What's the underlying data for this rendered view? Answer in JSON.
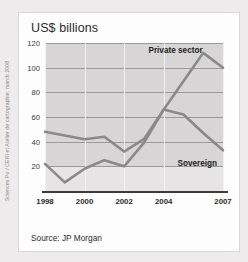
{
  "credit": {
    "text": "Sciences Po / CERI et Atelier de cartographie, march 2008"
  },
  "card": {
    "title": "US$ billions",
    "source_note": "Source: JP Morgan"
  },
  "chart_data": {
    "type": "line",
    "title": "US$ billions",
    "xlabel": "",
    "ylabel": "US$ billions",
    "ylim": [
      0,
      120
    ],
    "yticks": [
      20,
      40,
      60,
      80,
      100,
      120
    ],
    "xticks": [
      "1998",
      "2000",
      "2002",
      "2004",
      "2007"
    ],
    "x": [
      1998,
      1999,
      2000,
      2001,
      2002,
      2003,
      2004,
      2005,
      2006,
      2007
    ],
    "grid": "horizontal",
    "legend_position": "inline-annotation",
    "series": [
      {
        "name": "Private sector",
        "color": "#8b8888",
        "values": [
          48,
          45,
          42,
          44,
          32,
          42,
          66,
          89,
          112,
          100
        ],
        "annotation": "Private sector"
      },
      {
        "name": "Sovereign",
        "color": "#8b8888",
        "values": [
          22,
          7,
          18,
          25,
          20,
          39,
          66,
          62,
          47,
          33
        ],
        "annotation": "Sovereign"
      }
    ],
    "annotations": [
      {
        "text": "Private sector",
        "x": 2004.6,
        "y": 114
      },
      {
        "text": "Sovereign",
        "x": 2005.7,
        "y": 23
      }
    ]
  }
}
